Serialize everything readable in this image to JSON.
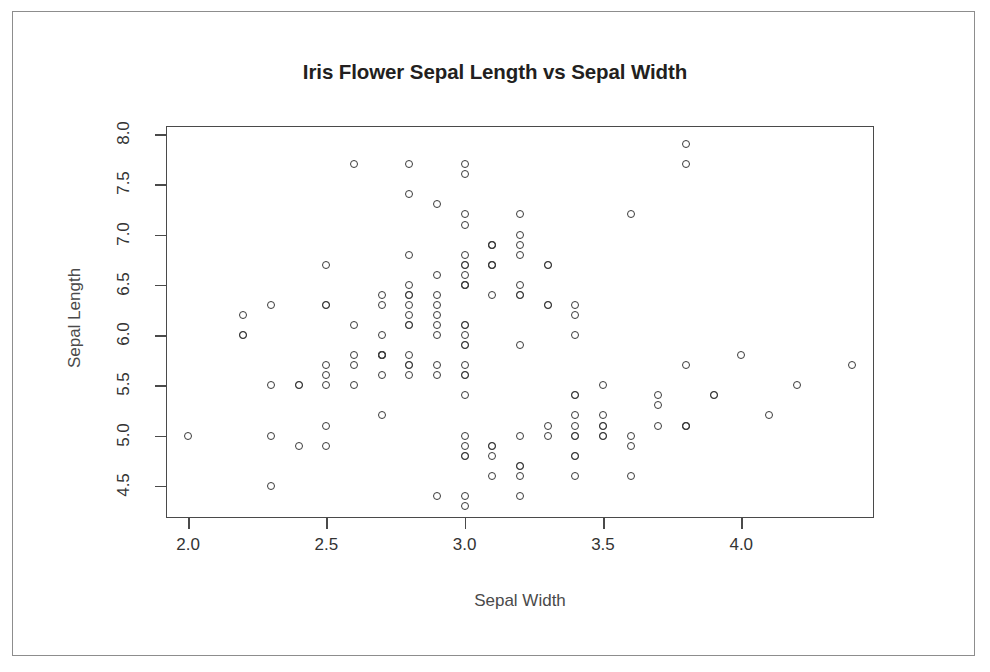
{
  "chart_data": {
    "type": "scatter",
    "title": "Iris Flower Sepal Length vs Sepal Width",
    "xlabel": "Sepal Width",
    "ylabel": "Sepal Length",
    "xlim": [
      1.92,
      4.48
    ],
    "ylim": [
      4.18,
      8.08
    ],
    "xticks": [
      2.0,
      2.5,
      3.0,
      3.5,
      4.0
    ],
    "xtick_labels": [
      "2.0",
      "2.5",
      "3.0",
      "3.5",
      "4.0"
    ],
    "yticks": [
      4.5,
      5.0,
      5.5,
      6.0,
      6.5,
      7.0,
      7.5,
      8.0
    ],
    "ytick_labels": [
      "4.5",
      "5.0",
      "5.5",
      "6.0",
      "6.5",
      "7.0",
      "7.5",
      "8.0"
    ],
    "grid": false,
    "legend": null,
    "marker": "open-circle",
    "marker_color": "#3a3a3a",
    "n_points": 150,
    "x": [
      3.5,
      3.0,
      3.2,
      3.1,
      3.6,
      3.9,
      3.4,
      3.4,
      2.9,
      3.1,
      3.7,
      3.4,
      3.0,
      3.0,
      4.0,
      4.4,
      3.9,
      3.5,
      3.8,
      3.8,
      3.4,
      3.7,
      3.6,
      3.3,
      3.4,
      3.0,
      3.4,
      3.5,
      3.4,
      3.2,
      3.1,
      3.4,
      4.1,
      4.2,
      3.1,
      3.2,
      3.5,
      3.6,
      3.0,
      3.4,
      3.5,
      2.3,
      3.2,
      3.5,
      3.8,
      3.0,
      3.8,
      3.2,
      3.7,
      3.3,
      3.2,
      3.2,
      3.1,
      2.3,
      2.8,
      2.8,
      3.3,
      2.4,
      2.9,
      2.7,
      2.0,
      3.0,
      2.2,
      2.9,
      2.9,
      3.1,
      3.0,
      2.7,
      2.2,
      2.5,
      3.2,
      2.8,
      2.5,
      2.8,
      2.9,
      3.0,
      2.8,
      3.0,
      2.9,
      2.6,
      2.4,
      2.4,
      2.7,
      2.7,
      3.0,
      3.4,
      3.1,
      2.3,
      3.0,
      2.5,
      2.6,
      3.0,
      2.6,
      2.3,
      2.7,
      3.0,
      2.9,
      2.9,
      2.5,
      2.8,
      3.3,
      2.7,
      3.0,
      2.9,
      3.0,
      3.0,
      2.5,
      2.9,
      2.5,
      3.6,
      3.2,
      2.7,
      3.0,
      2.5,
      2.8,
      3.2,
      3.0,
      3.8,
      2.6,
      2.2,
      3.2,
      2.8,
      2.8,
      2.7,
      3.3,
      3.2,
      2.8,
      3.0,
      2.8,
      3.0,
      2.8,
      3.8,
      2.8,
      2.8,
      2.6,
      3.0,
      3.4,
      3.1,
      3.0,
      3.1,
      3.1,
      3.1,
      2.7,
      3.2,
      3.3,
      3.0,
      2.5,
      3.0,
      3.4,
      3.0
    ],
    "y": [
      5.1,
      4.9,
      4.7,
      4.6,
      5.0,
      5.4,
      4.6,
      5.0,
      4.4,
      4.9,
      5.4,
      4.8,
      4.8,
      4.3,
      5.8,
      5.7,
      5.4,
      5.1,
      5.7,
      5.1,
      5.4,
      5.1,
      4.6,
      5.1,
      4.8,
      5.0,
      5.0,
      5.2,
      5.2,
      4.7,
      4.8,
      5.4,
      5.2,
      5.5,
      4.9,
      5.0,
      5.5,
      4.9,
      4.4,
      5.1,
      5.0,
      4.5,
      4.4,
      5.0,
      5.1,
      4.8,
      5.1,
      4.6,
      5.3,
      5.0,
      7.0,
      6.4,
      6.9,
      5.5,
      6.5,
      5.7,
      6.3,
      4.9,
      6.6,
      5.2,
      5.0,
      5.9,
      6.0,
      6.1,
      5.6,
      6.7,
      5.6,
      5.8,
      6.2,
      5.6,
      5.9,
      6.1,
      6.3,
      6.1,
      6.4,
      6.6,
      6.8,
      6.7,
      6.0,
      5.7,
      5.5,
      5.5,
      5.8,
      6.0,
      5.4,
      6.0,
      6.7,
      6.3,
      5.6,
      5.5,
      5.5,
      6.1,
      5.8,
      5.0,
      5.6,
      5.7,
      5.7,
      6.2,
      5.1,
      5.7,
      6.3,
      5.8,
      7.1,
      6.3,
      6.5,
      7.6,
      4.9,
      7.3,
      6.7,
      7.2,
      6.5,
      6.4,
      6.8,
      5.7,
      5.8,
      6.4,
      6.5,
      7.7,
      7.7,
      6.0,
      6.9,
      5.6,
      7.7,
      6.3,
      6.7,
      7.2,
      6.2,
      6.1,
      6.4,
      7.2,
      7.4,
      7.9,
      6.4,
      6.3,
      6.1,
      7.7,
      6.3,
      6.4,
      6.0,
      6.9,
      6.7,
      6.9,
      5.8,
      6.8,
      6.7,
      6.7,
      6.3,
      6.5,
      6.2,
      5.9
    ]
  }
}
